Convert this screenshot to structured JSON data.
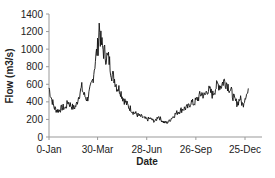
{
  "chart_data": {
    "type": "line",
    "title": "",
    "xlabel": "Date",
    "ylabel": "Flow (m3/s)",
    "ylim": [
      0,
      1400
    ],
    "yticks": [
      0,
      200,
      400,
      600,
      800,
      1000,
      1200,
      1400
    ],
    "xlim": [
      0,
      365
    ],
    "xticks": [
      {
        "day": 0,
        "label": "0-Jan"
      },
      {
        "day": 89,
        "label": "30-Mar"
      },
      {
        "day": 179,
        "label": "28-Jun"
      },
      {
        "day": 269,
        "label": "26-Sep"
      },
      {
        "day": 359,
        "label": "25-Dec"
      }
    ],
    "grid": false,
    "legend": null,
    "series": [
      {
        "name": "Flow",
        "color": "#111111",
        "x": [
          0,
          5,
          10,
          15,
          20,
          25,
          30,
          35,
          40,
          45,
          50,
          55,
          60,
          65,
          70,
          75,
          80,
          85,
          90,
          92,
          95,
          100,
          105,
          110,
          115,
          120,
          125,
          130,
          135,
          140,
          145,
          150,
          155,
          160,
          165,
          170,
          175,
          180,
          185,
          190,
          195,
          200,
          205,
          210,
          215,
          220,
          225,
          230,
          235,
          240,
          245,
          250,
          255,
          260,
          265,
          270,
          275,
          280,
          285,
          290,
          295,
          300,
          305,
          310,
          315,
          320,
          325,
          330,
          335,
          340,
          345,
          350,
          355,
          360,
          365
        ],
        "y": [
          560,
          430,
          330,
          300,
          310,
          340,
          330,
          400,
          360,
          330,
          360,
          480,
          560,
          470,
          430,
          520,
          650,
          880,
          1050,
          1270,
          1080,
          980,
          920,
          880,
          720,
          660,
          560,
          540,
          450,
          400,
          350,
          320,
          280,
          260,
          240,
          230,
          210,
          200,
          210,
          190,
          180,
          240,
          200,
          170,
          160,
          180,
          220,
          250,
          280,
          300,
          320,
          330,
          340,
          400,
          380,
          420,
          460,
          500,
          460,
          540,
          520,
          480,
          560,
          600,
          580,
          640,
          620,
          560,
          500,
          420,
          380,
          440,
          360,
          480,
          500
        ]
      }
    ]
  }
}
